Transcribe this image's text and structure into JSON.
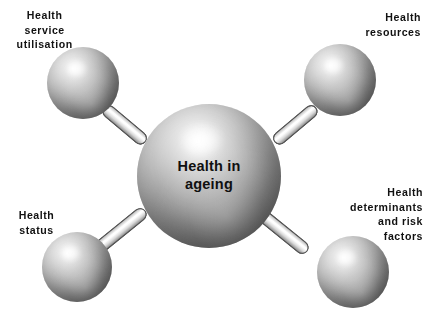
{
  "diagram": {
    "title": "Health in ageing",
    "background_color": "#ffffff",
    "text_color": "#111111",
    "center_node": {
      "id": "health-in-ageing",
      "label": "Health in\nageing"
    },
    "nodes": [
      {
        "id": "health-service-utilisation",
        "label": "Health\nservice\nutilisation",
        "position": "top-left"
      },
      {
        "id": "health-resources",
        "label": "Health\nresources",
        "position": "top-right"
      },
      {
        "id": "health-status",
        "label": "Health\nstatus",
        "position": "bottom-left"
      },
      {
        "id": "health-determinants-and-risk-factors",
        "label": "Health\ndeterminants\nand risk\nfactors",
        "position": "bottom-right"
      }
    ],
    "connectors": [
      {
        "id": "connector-top-left",
        "from": "health-in-ageing",
        "to": "health-service-utilisation"
      },
      {
        "id": "connector-top-right",
        "from": "health-in-ageing",
        "to": "health-resources"
      },
      {
        "id": "connector-bottom-left",
        "from": "health-in-ageing",
        "to": "health-status"
      },
      {
        "id": "connector-bottom-right",
        "from": "health-in-ageing",
        "to": "health-determinants-and-risk-factors"
      }
    ]
  }
}
